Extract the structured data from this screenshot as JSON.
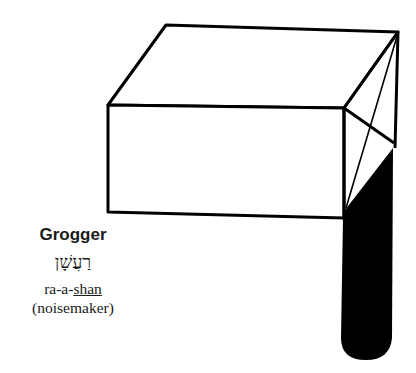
{
  "illustration": {
    "subject": "grogger",
    "ink_color": "#000000",
    "background_color": "#ffffff"
  },
  "caption": {
    "title": "Grogger",
    "hebrew": "רַעֲשָׁן",
    "transliteration": {
      "prefix": "ra-a-",
      "stressed": "shan"
    },
    "translation": "(noisemaker)"
  }
}
